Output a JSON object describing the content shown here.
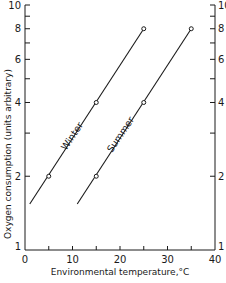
{
  "chart_data": {
    "type": "line",
    "title": "",
    "xlabel": "Environmental temperature,°C",
    "ylabel": "Oxygen consumption (units arbitrary)",
    "xlim": [
      0,
      40
    ],
    "ylim": [
      1,
      10
    ],
    "yscale": "log",
    "grid": false,
    "x_ticks": [
      0,
      10,
      20,
      30,
      40
    ],
    "x_minor_ticks": [
      5,
      15,
      25,
      35
    ],
    "y_ticks": [
      1,
      2,
      4,
      6,
      8,
      10
    ],
    "y_minor_ticks": [
      3,
      5,
      7,
      9
    ],
    "right_axis_ticks": [
      1,
      2,
      4,
      6,
      8,
      10
    ],
    "series": [
      {
        "name": "Winter",
        "points": [
          {
            "x": 5,
            "y": 2
          },
          {
            "x": 15,
            "y": 4
          },
          {
            "x": 25,
            "y": 8
          }
        ],
        "line_range": {
          "x_start": 1,
          "y_start": 1.54,
          "x_end": 25,
          "y_end": 8
        }
      },
      {
        "name": "Summer",
        "points": [
          {
            "x": 15,
            "y": 2
          },
          {
            "x": 25,
            "y": 4
          },
          {
            "x": 35,
            "y": 8
          }
        ],
        "line_range": {
          "x_start": 11,
          "y_start": 1.54,
          "x_end": 35,
          "y_end": 8
        }
      }
    ],
    "annotations": [
      "Winter",
      "Summer"
    ]
  },
  "labels": {
    "x_axis": "Environmental temperature,°C",
    "y_axis": "Oxygen consumption (units arbitrary)",
    "winter": "Winter",
    "summer": "Summer",
    "x_tick_0": "0",
    "x_tick_10": "10",
    "x_tick_20": "20",
    "x_tick_30": "30",
    "x_tick_40": "40",
    "y_tick_1": "1",
    "y_tick_2": "2",
    "y_tick_4": "4",
    "y_tick_6": "6",
    "y_tick_8": "8",
    "y_tick_10": "10"
  }
}
